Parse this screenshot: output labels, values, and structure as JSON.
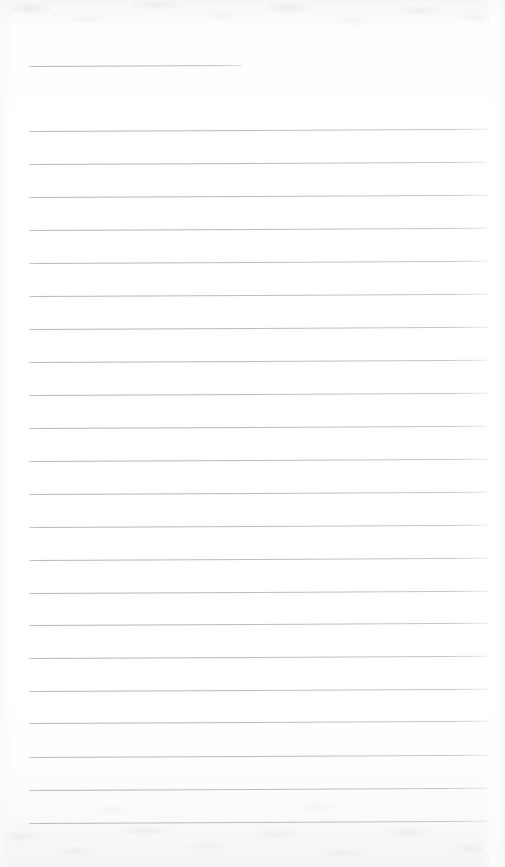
{
  "document": {
    "kind": "ruled-notebook-page",
    "title_text": "",
    "body_text": "",
    "page_width": 505,
    "page_height": 867
  },
  "paper": {
    "background_color": "#fefefe",
    "edge_tint_color": "#f4f4f5",
    "has_top_scan_texture": true,
    "has_bottom_scan_texture": true
  },
  "ruling": {
    "line_color": "#b5b8bd",
    "line_thickness_px": 1,
    "line_spacing_px": 33,
    "left_margin_x": 29,
    "right_margin_x": 487,
    "tilt_degrees": -0.28,
    "total_lines": 23,
    "lines": [
      {
        "id": "rule-1",
        "y": 66,
        "x1": 29,
        "x2": 242,
        "kind": "short",
        "label": "title-rule"
      },
      {
        "id": "rule-2",
        "y": 131,
        "x1": 29,
        "x2": 487,
        "kind": "full",
        "label": "body-rule"
      },
      {
        "id": "rule-3",
        "y": 164,
        "x1": 29,
        "x2": 487,
        "kind": "full",
        "label": "body-rule"
      },
      {
        "id": "rule-4",
        "y": 197,
        "x1": 29,
        "x2": 487,
        "kind": "full",
        "label": "body-rule"
      },
      {
        "id": "rule-5",
        "y": 230,
        "x1": 29,
        "x2": 487,
        "kind": "full",
        "label": "body-rule"
      },
      {
        "id": "rule-6",
        "y": 263,
        "x1": 29,
        "x2": 487,
        "kind": "full",
        "label": "body-rule"
      },
      {
        "id": "rule-7",
        "y": 296,
        "x1": 29,
        "x2": 487,
        "kind": "full",
        "label": "body-rule"
      },
      {
        "id": "rule-8",
        "y": 329,
        "x1": 29,
        "x2": 487,
        "kind": "full",
        "label": "body-rule"
      },
      {
        "id": "rule-9",
        "y": 362,
        "x1": 29,
        "x2": 487,
        "kind": "full",
        "label": "body-rule"
      },
      {
        "id": "rule-10",
        "y": 395,
        "x1": 29,
        "x2": 487,
        "kind": "full",
        "label": "body-rule"
      },
      {
        "id": "rule-11",
        "y": 428,
        "x1": 29,
        "x2": 487,
        "kind": "full",
        "label": "body-rule"
      },
      {
        "id": "rule-12",
        "y": 461,
        "x1": 29,
        "x2": 487,
        "kind": "full",
        "label": "body-rule"
      },
      {
        "id": "rule-13",
        "y": 494,
        "x1": 29,
        "x2": 487,
        "kind": "full",
        "label": "body-rule"
      },
      {
        "id": "rule-14",
        "y": 527,
        "x1": 29,
        "x2": 487,
        "kind": "full",
        "label": "body-rule"
      },
      {
        "id": "rule-15",
        "y": 560,
        "x1": 29,
        "x2": 487,
        "kind": "full",
        "label": "body-rule"
      },
      {
        "id": "rule-16",
        "y": 593,
        "x1": 29,
        "x2": 487,
        "kind": "full",
        "label": "body-rule"
      },
      {
        "id": "rule-17",
        "y": 625,
        "x1": 29,
        "x2": 487,
        "kind": "full",
        "label": "body-rule"
      },
      {
        "id": "rule-18",
        "y": 658,
        "x1": 29,
        "x2": 487,
        "kind": "full",
        "label": "body-rule"
      },
      {
        "id": "rule-19",
        "y": 691,
        "x1": 29,
        "x2": 487,
        "kind": "full",
        "label": "body-rule"
      },
      {
        "id": "rule-20",
        "y": 723,
        "x1": 29,
        "x2": 487,
        "kind": "full",
        "label": "body-rule"
      },
      {
        "id": "rule-21",
        "y": 757,
        "x1": 29,
        "x2": 487,
        "kind": "full",
        "label": "body-rule"
      },
      {
        "id": "rule-22",
        "y": 790,
        "x1": 29,
        "x2": 487,
        "kind": "full",
        "label": "body-rule"
      },
      {
        "id": "rule-23",
        "y": 823,
        "x1": 29,
        "x2": 487,
        "kind": "full",
        "label": "body-rule"
      }
    ]
  }
}
